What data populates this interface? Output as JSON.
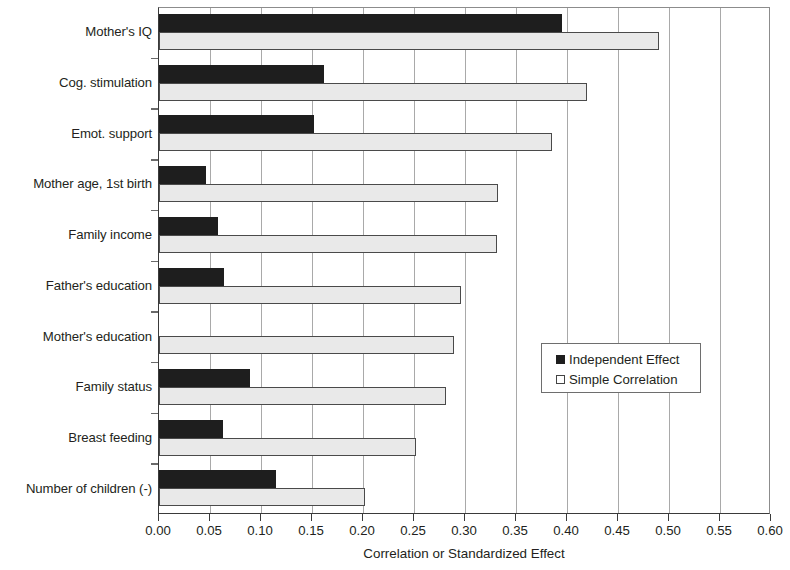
{
  "chart_data": {
    "type": "bar",
    "orientation": "horizontal",
    "title": "",
    "xlabel": "Correlation or Standardized Effect",
    "ylabel": "",
    "xlim": [
      0.0,
      0.6
    ],
    "xticks": [
      "0.00",
      "0.05",
      "0.10",
      "0.15",
      "0.20",
      "0.25",
      "0.30",
      "0.35",
      "0.40",
      "0.45",
      "0.50",
      "0.55",
      "0.60"
    ],
    "xtick_values": [
      0.0,
      0.05,
      0.1,
      0.15,
      0.2,
      0.25,
      0.3,
      0.35,
      0.4,
      0.45,
      0.5,
      0.55,
      0.6
    ],
    "grid": true,
    "grid_axis": "x",
    "legend_position": "center-right",
    "categories": [
      "Mother's IQ",
      "Cog. stimulation",
      "Emot. support",
      "Mother age, 1st birth",
      "Family income",
      "Father's education",
      "Mother's education",
      "Family status",
      "Breast feeding",
      "Number of children (-)"
    ],
    "series": [
      {
        "name": "Independent Effect",
        "color": "#1e1e1e",
        "values": [
          0.395,
          0.162,
          0.152,
          0.046,
          0.058,
          0.064,
          0.0,
          0.089,
          0.063,
          0.115
        ]
      },
      {
        "name": "Simple Correlation",
        "color": "#e9e9e9",
        "values": [
          0.49,
          0.42,
          0.385,
          0.332,
          0.331,
          0.296,
          0.289,
          0.281,
          0.252,
          0.202
        ]
      }
    ]
  },
  "legend": {
    "entries": [
      {
        "label": "Independent Effect",
        "swatch": "dark"
      },
      {
        "label": "Simple Correlation",
        "swatch": "light"
      }
    ]
  },
  "axis": {
    "x_title": "Correlation or Standardized Effect"
  }
}
